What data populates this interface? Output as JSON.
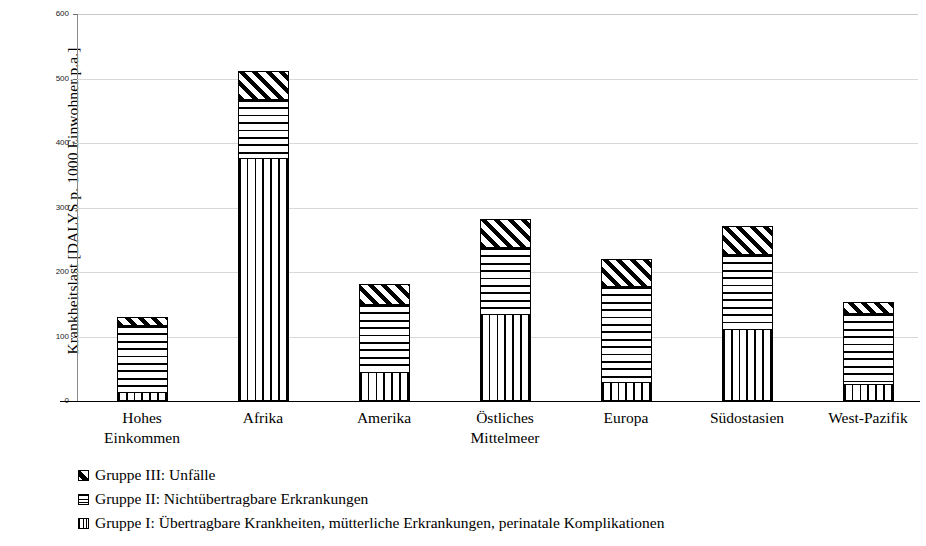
{
  "chart_data": {
    "type": "bar",
    "stacked": true,
    "title": "",
    "xlabel": "",
    "ylabel": "Krankheitslast [DALYS p. 1000 Einwohner p.a.]",
    "ylim": [
      0,
      600
    ],
    "yticks": [
      0,
      100,
      200,
      300,
      400,
      500,
      600
    ],
    "ytick_labels": [
      "0",
      "100",
      "200",
      "300",
      "400",
      "500",
      "600"
    ],
    "grid": true,
    "legend_position": "below",
    "categories": [
      "Hohes Einkommen",
      "Afrika",
      "Amerika",
      "Östliches Mittelmeer",
      "Europa",
      "Südostasien",
      "West-Pazifik"
    ],
    "category_lines": [
      [
        "Hohes",
        "Einkommen"
      ],
      [
        "Afrika"
      ],
      [
        "Amerika"
      ],
      [
        "Östliches",
        "Mittelmeer"
      ],
      [
        "Europa"
      ],
      [
        "Südostasien"
      ],
      [
        "West-Pazifik"
      ]
    ],
    "series": [
      {
        "name": "Gruppe I: Übertragbare Krankheiten, mütterliche Erkrankungen, perinatale Komplikationen",
        "key": "g1",
        "pattern": "vertical-lines",
        "values": [
          13,
          375,
          43,
          133,
          28,
          110,
          25
        ]
      },
      {
        "name": "Gruppe II: Nichtübertragbare Erkrankungen",
        "key": "g2",
        "pattern": "horizontal-lines",
        "values": [
          104,
          91,
          106,
          104,
          149,
          116,
          110
        ]
      },
      {
        "name": "Gruppe III: Unfälle",
        "key": "g3",
        "pattern": "diagonal-hatch",
        "values": [
          13,
          45,
          32,
          45,
          43,
          45,
          18
        ]
      }
    ],
    "totals": [
      130,
      511,
      181,
      282,
      220,
      271,
      153
    ]
  },
  "legend": {
    "entries": [
      {
        "swatch": "g3",
        "label": "Gruppe III: Unfälle"
      },
      {
        "swatch": "g2",
        "label": "Gruppe II: Nichtübertragbare Erkrankungen"
      },
      {
        "swatch": "g1",
        "label": "Gruppe I: Übertragbare Krankheiten, mütterliche Erkrankungen, perinatale Komplikationen"
      }
    ]
  },
  "colors": {
    "plot_background": "#ffffff",
    "axis": "#000000",
    "gridline": "#d8d8d8",
    "pattern_ink": "#000000"
  }
}
